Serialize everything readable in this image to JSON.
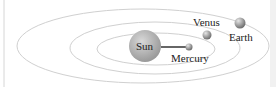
{
  "diagram": {
    "bodies": [
      {
        "name": "Sun",
        "label": "Sun"
      },
      {
        "name": "Mercury",
        "label": "Mercury"
      },
      {
        "name": "Venus",
        "label": "Venus"
      },
      {
        "name": "Earth",
        "label": "Earth"
      }
    ],
    "colors": {
      "orbit": "#cfcfcf",
      "sun": "#a8a8a8",
      "planet": "#8c8c8c",
      "connector": "#333333",
      "text": "#222222"
    }
  }
}
